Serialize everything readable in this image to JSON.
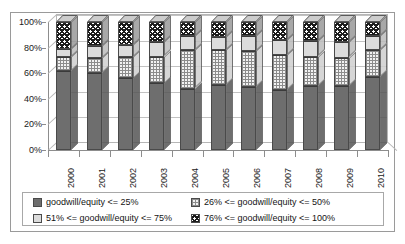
{
  "chart_data": {
    "type": "bar",
    "subtype": "stacked-percent-3d",
    "title": "",
    "xlabel": "",
    "ylabel": "",
    "ylim": [
      0,
      100
    ],
    "yticks": [
      0,
      20,
      40,
      60,
      80,
      100
    ],
    "ytick_labels": [
      "0%",
      "20%",
      "40%",
      "60%",
      "80%",
      "100%"
    ],
    "grid": true,
    "legend_position": "bottom",
    "categories": [
      "2000",
      "2001",
      "2002",
      "2003",
      "2004",
      "2005",
      "2006",
      "2007",
      "2008",
      "2009",
      "2010"
    ],
    "series": [
      {
        "name": "goodwill/equity <= 25%",
        "color": "#6e6e6e",
        "pattern": "solid-dark-gray",
        "values": [
          62,
          60,
          56,
          52,
          48,
          51,
          49,
          47,
          50,
          50,
          57
        ]
      },
      {
        "name": "26% <= goodwill/equity <= 50%",
        "color": "#f2f2f2",
        "pattern": "fine-checker",
        "values": [
          11,
          12,
          17,
          21,
          30,
          27,
          28,
          27,
          23,
          22,
          21
        ]
      },
      {
        "name": "51% <= goodwill/equity <= 75%",
        "color": "#dcdcdc",
        "pattern": "solid-light-gray",
        "values": [
          6,
          9,
          9,
          11,
          11,
          10,
          12,
          12,
          12,
          12,
          11
        ]
      },
      {
        "name": "76% <= goodwill/equity <= 100%",
        "color": "#1c1c1c",
        "pattern": "bold-checker",
        "values": [
          21,
          19,
          18,
          16,
          11,
          12,
          11,
          14,
          15,
          16,
          11
        ]
      }
    ]
  },
  "legend": {
    "items": [
      {
        "label": "goodwill/equity <= 25%",
        "series_index": 0
      },
      {
        "label": "26% <= goodwill/equity <= 50%",
        "series_index": 1
      },
      {
        "label": "51% <= goodwill/equity <= 75%",
        "series_index": 2
      },
      {
        "label": "76% <= goodwill/equity <= 100%",
        "series_index": 3
      }
    ]
  }
}
